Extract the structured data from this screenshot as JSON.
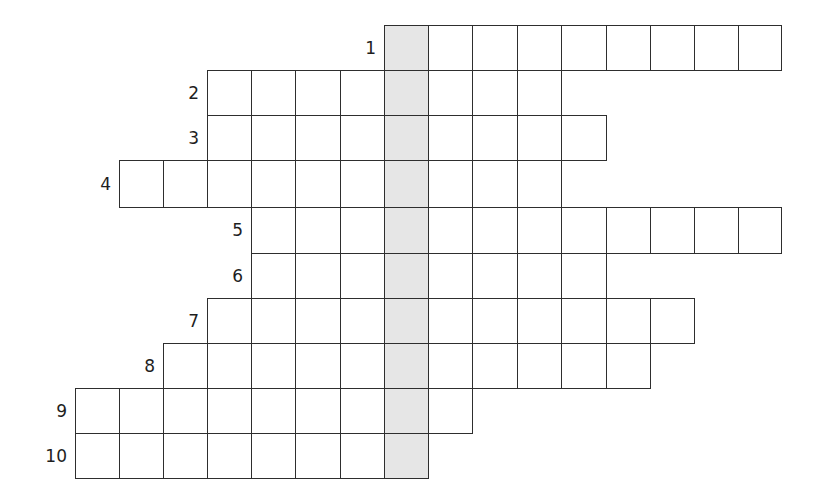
{
  "puzzle": {
    "type": "crossword",
    "highlight_column": 7,
    "highlight_color": "#e6e6e6",
    "line_color": "#2e2e2e",
    "column_x": [
      75,
      119,
      163,
      207,
      251,
      295,
      340,
      384,
      428,
      472,
      517,
      561,
      606,
      650,
      694,
      738,
      781
    ],
    "row_y": [
      25,
      70,
      115,
      160,
      207,
      253,
      298,
      343,
      388,
      433,
      478
    ],
    "rows": [
      {
        "label": "1",
        "start_col": 7,
        "end_col": 16
      },
      {
        "label": "2",
        "start_col": 3,
        "end_col": 11
      },
      {
        "label": "3",
        "start_col": 3,
        "end_col": 12
      },
      {
        "label": "4",
        "start_col": 1,
        "end_col": 11
      },
      {
        "label": "5",
        "start_col": 4,
        "end_col": 16
      },
      {
        "label": "6",
        "start_col": 4,
        "end_col": 12
      },
      {
        "label": "7",
        "start_col": 3,
        "end_col": 14
      },
      {
        "label": "8",
        "start_col": 2,
        "end_col": 13
      },
      {
        "label": "9",
        "start_col": 0,
        "end_col": 9
      },
      {
        "label": "10",
        "start_col": 0,
        "end_col": 8
      }
    ]
  }
}
